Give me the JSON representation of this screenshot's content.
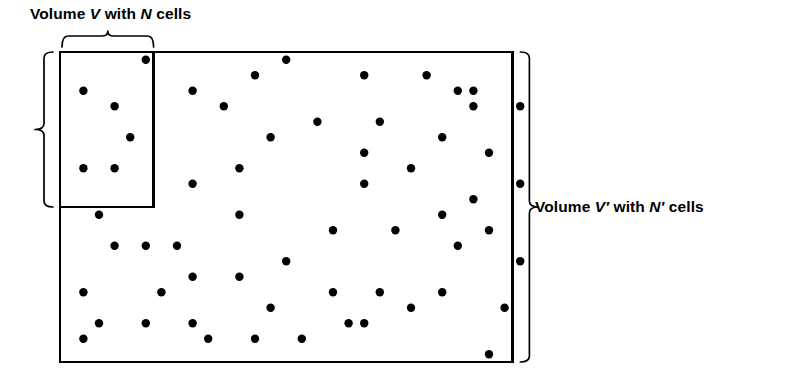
{
  "figure": {
    "background_color": "#ffffff",
    "ink_color": "#000000"
  },
  "labels": {
    "top": {
      "text": "Volume V with N cells",
      "parts": [
        {
          "t": "Volume ",
          "italic": false
        },
        {
          "t": "V",
          "italic": true
        },
        {
          "t": " with ",
          "italic": false
        },
        {
          "t": "N",
          "italic": true
        },
        {
          "t": " cells",
          "italic": false
        }
      ]
    },
    "right": {
      "text": "Volume V′ with N′ cells",
      "parts": [
        {
          "t": "Volume ",
          "italic": false
        },
        {
          "t": "V′",
          "italic": true
        },
        {
          "t": " with ",
          "italic": false
        },
        {
          "t": "N′",
          "italic": true
        },
        {
          "t": " cells",
          "italic": false
        }
      ]
    }
  },
  "grid": {
    "columns": 29,
    "rows": 20,
    "cell_width": 15.6,
    "cell_height": 15.5,
    "origin_x": 60,
    "origin_y": 52,
    "minor_line_color": "#1a1a1a",
    "major_line_color": "#000000",
    "major_every_columns": 5,
    "major_every_rows": 5,
    "border_color": "#000000"
  },
  "subvolume": {
    "name": "V",
    "columns": 6,
    "rows": 10,
    "start_col": 0,
    "start_row": 0,
    "border_color": "#000000"
  },
  "braces": {
    "top": {
      "label_ref": "labels.top",
      "spans": "subvolume width"
    },
    "left": {
      "label_ref": "labels.top",
      "spans": "subvolume height"
    },
    "right": {
      "label_ref": "labels.right",
      "spans": "full grid height"
    }
  },
  "dots": {
    "radius": 4.2,
    "color": "#000000",
    "count": 62,
    "cells": [
      [
        5,
        0
      ],
      [
        14,
        0
      ],
      [
        12,
        1
      ],
      [
        19,
        1
      ],
      [
        23,
        1
      ],
      [
        1,
        2
      ],
      [
        8,
        2
      ],
      [
        25,
        2
      ],
      [
        26,
        2
      ],
      [
        3,
        3
      ],
      [
        10,
        3
      ],
      [
        26,
        3
      ],
      [
        29,
        3
      ],
      [
        16,
        4
      ],
      [
        20,
        4
      ],
      [
        4,
        5
      ],
      [
        13,
        5
      ],
      [
        24,
        5
      ],
      [
        19,
        6
      ],
      [
        27,
        6
      ],
      [
        1,
        7
      ],
      [
        3,
        7
      ],
      [
        11,
        7
      ],
      [
        22,
        7
      ],
      [
        8,
        8
      ],
      [
        19,
        8
      ],
      [
        29,
        8
      ],
      [
        26,
        9
      ],
      [
        2,
        10
      ],
      [
        11,
        10
      ],
      [
        24,
        10
      ],
      [
        17,
        11
      ],
      [
        21,
        11
      ],
      [
        27,
        11
      ],
      [
        3,
        12
      ],
      [
        5,
        12
      ],
      [
        7,
        12
      ],
      [
        25,
        12
      ],
      [
        14,
        13
      ],
      [
        29,
        13
      ],
      [
        8,
        14
      ],
      [
        11,
        14
      ],
      [
        1,
        15
      ],
      [
        6,
        15
      ],
      [
        17,
        15
      ],
      [
        20,
        15
      ],
      [
        24,
        15
      ],
      [
        13,
        16
      ],
      [
        22,
        16
      ],
      [
        28,
        16
      ],
      [
        2,
        17
      ],
      [
        5,
        17
      ],
      [
        8,
        17
      ],
      [
        18,
        17
      ],
      [
        19,
        17
      ],
      [
        1,
        18
      ],
      [
        9,
        18
      ],
      [
        12,
        18
      ],
      [
        15,
        18
      ],
      [
        27,
        19
      ]
    ]
  }
}
